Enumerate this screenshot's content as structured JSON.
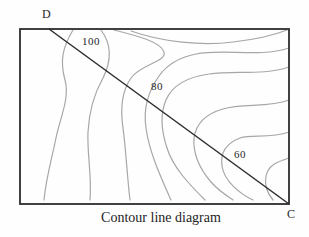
{
  "figure": {
    "caption": "Contour line diagram",
    "corner_labels": {
      "top_left": "D",
      "bottom_right": "C"
    },
    "contour_labels": [
      {
        "value": "100",
        "x": 91,
        "y": 41
      },
      {
        "value": "80",
        "x": 157,
        "y": 86
      },
      {
        "value": "60",
        "x": 240,
        "y": 154
      }
    ],
    "frame": {
      "x": 20,
      "y": 29,
      "width": 269,
      "height": 175
    },
    "diagonal": {
      "x1": 49,
      "y1": 29,
      "x2": 289,
      "y2": 204
    },
    "contour_paths": [
      "M73,30 C62,48 60,62 65,80 C70,98 60,118 56,138 C52,158 46,178 44,200",
      "M101,30 C113,46 111,62 103,78 C94,94 89,112 88,132 C87,155 92,175 90,200",
      "M114,30 C138,36 161,42 164,52 C167,62 141,64 131,78 C122,91 120,108 123,128 C126,150 127,175 130,200",
      "M131,31 C162,42 202,46 233,42 C259,39 277,34 287,30",
      "M289,48 C258,58 224,48 196,54 C176,58 166,66 159,76 C149,90 143,108 146,128 C149,152 162,180 171,200",
      "M289,67 C262,76 234,70 209,74 C187,77 172,86 166,100 C160,114 161,130 167,148 C173,168 191,186 205,200",
      "M289,100 C268,108 243,103 223,109 C205,114 196,124 194,138 C193,152 199,168 211,182 C219,191 227,196 233,200",
      "M289,132 C270,139 252,134 240,138 C227,143 220,152 222,166 C224,181 240,194 253,200",
      "M289,158 C276,162 268,166 266,176 C264,186 268,194 273,200"
    ],
    "colors": {
      "frame": "#2d2d2d",
      "diagonal": "#2d2d2d",
      "contour": "#a7a7a7",
      "background": "#fefefe",
      "text": "#1f1f1f"
    }
  }
}
